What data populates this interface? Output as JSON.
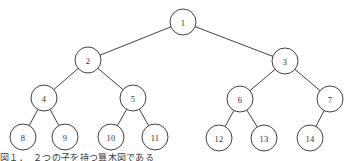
{
  "figure": {
    "width": 348,
    "height": 161,
    "background_color": "#ffffff",
    "stroke_color": "#2b2b2b",
    "label_color": "#333333",
    "node_radius": 13,
    "caption_text": "図１．　２つの子を持つ算木図である"
  },
  "tree": {
    "type": "binary-tree",
    "nodes": [
      {
        "id": "1",
        "label": "1",
        "cx": 183,
        "cy": 22,
        "level": 0
      },
      {
        "id": "2",
        "label": "2",
        "cx": 88,
        "cy": 60,
        "level": 1
      },
      {
        "id": "3",
        "label": "3",
        "cx": 285,
        "cy": 61,
        "level": 1
      },
      {
        "id": "4",
        "label": "4",
        "cx": 44,
        "cy": 98,
        "level": 2
      },
      {
        "id": "5",
        "label": "5",
        "cx": 133,
        "cy": 98,
        "level": 2
      },
      {
        "id": "6",
        "label": "6",
        "cx": 240,
        "cy": 99,
        "level": 2
      },
      {
        "id": "7",
        "label": "7",
        "cx": 330,
        "cy": 99,
        "level": 2
      },
      {
        "id": "8",
        "label": "8",
        "cx": 23,
        "cy": 137,
        "level": 3
      },
      {
        "id": "9",
        "label": "9",
        "cx": 65,
        "cy": 137,
        "level": 3
      },
      {
        "id": "10",
        "label": "10",
        "cx": 111,
        "cy": 137,
        "level": 3
      },
      {
        "id": "11",
        "label": "11",
        "cx": 155,
        "cy": 137,
        "level": 3
      },
      {
        "id": "12",
        "label": "12",
        "cx": 219,
        "cy": 138,
        "level": 3
      },
      {
        "id": "13",
        "label": "13",
        "cx": 264,
        "cy": 138,
        "level": 3
      },
      {
        "id": "14",
        "label": "14",
        "cx": 310,
        "cy": 138,
        "level": 3
      }
    ],
    "edges": [
      {
        "from": "1",
        "to": "2"
      },
      {
        "from": "1",
        "to": "3"
      },
      {
        "from": "2",
        "to": "4"
      },
      {
        "from": "2",
        "to": "5"
      },
      {
        "from": "3",
        "to": "6"
      },
      {
        "from": "3",
        "to": "7"
      },
      {
        "from": "4",
        "to": "8"
      },
      {
        "from": "4",
        "to": "9"
      },
      {
        "from": "5",
        "to": "10"
      },
      {
        "from": "5",
        "to": "11"
      },
      {
        "from": "6",
        "to": "12"
      },
      {
        "from": "6",
        "to": "13"
      },
      {
        "from": "7",
        "to": "14"
      }
    ]
  }
}
